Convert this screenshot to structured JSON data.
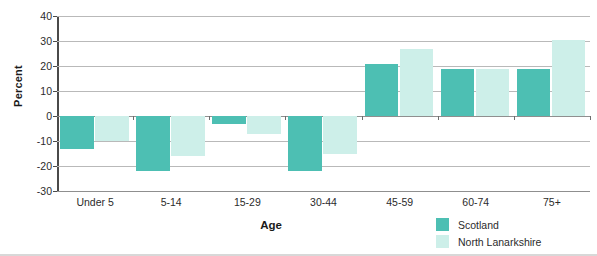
{
  "chart_data": {
    "type": "bar",
    "title": "",
    "xlabel": "Age",
    "ylabel": "Percent",
    "categories": [
      "Under 5",
      "5-14",
      "15-29",
      "30-44",
      "45-59",
      "60-74",
      "75+"
    ],
    "series": [
      {
        "name": "Scotland",
        "color": "#4dbfb3",
        "values": [
          -13,
          -22,
          -3,
          -22,
          21,
          19,
          19
        ]
      },
      {
        "name": "North Lanarkshire",
        "color": "#cdefe9",
        "values": [
          -10,
          -16,
          -7,
          -15,
          27,
          19,
          30.5
        ]
      }
    ],
    "ylim": [
      -30,
      40
    ],
    "yticks": [
      40,
      30,
      20,
      10,
      0,
      -10,
      -20,
      -30
    ],
    "ytick_labels": [
      "40",
      "30",
      "20",
      "10",
      "0",
      "-10",
      "-20",
      "-30"
    ],
    "grid": true,
    "legend_position": "bottom-right"
  },
  "legend": {
    "entries": [
      {
        "label": "Scotland",
        "color": "#4dbfb3"
      },
      {
        "label": "North Lanarkshire",
        "color": "#cdefe9"
      }
    ]
  }
}
